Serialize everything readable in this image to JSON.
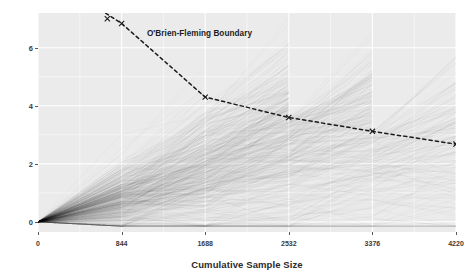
{
  "chart_data": {
    "type": "line",
    "title": "",
    "xlabel": "Cumulative Sample Size",
    "ylabel": "Cumulative Z-score",
    "xlim": [
      0,
      4220
    ],
    "ylim": [
      -0.35,
      7.2
    ],
    "xticks": [
      0,
      844,
      1688,
      2532,
      3376,
      4220
    ],
    "xticklabels": [
      "0",
      "844",
      "1688",
      "2532",
      "3376",
      "4220"
    ],
    "yticks": [
      0,
      2,
      4,
      6
    ],
    "yticklabels": [
      "0",
      "2",
      "4",
      "6"
    ],
    "grid": true,
    "legend": false,
    "panel_background": "#ebebeb",
    "grid_color": "#ffffff",
    "annotations": [
      {
        "text": "O'Brien-Fleming Boundary",
        "x": 1100,
        "y": 6.45
      }
    ],
    "series": [
      {
        "name": "O'Brien-Fleming Boundary",
        "style": "dashed",
        "color": "#1a1a1a",
        "marker": "x",
        "x": [
          844,
          1688,
          2532,
          3376,
          4220
        ],
        "values": [
          6.84,
          4.3,
          3.6,
          3.12,
          2.68
        ]
      },
      {
        "name": "Simulated trial trajectories",
        "style": "solid",
        "color": "#4d4d4d",
        "alpha": 0.06,
        "n_trials": 500,
        "stop_rule": "Stop when cumulative Z-score crosses the O'Brien-Fleming boundary",
        "x": [
          0,
          844,
          1688,
          2532,
          3376,
          4220
        ],
        "mean_path": [
          0,
          2.1,
          3.0,
          3.65,
          4.2,
          4.7
        ],
        "envelope_upper": [
          0,
          4.25,
          4.9,
          5.05,
          4.85,
          4.7
        ],
        "envelope_lower": [
          0,
          0.05,
          0.55,
          0.9,
          1.55,
          2.3
        ]
      }
    ]
  },
  "axis": {
    "xtitle": "Cumulative Sample Size",
    "ytitle": "Cumulative Z-score"
  }
}
